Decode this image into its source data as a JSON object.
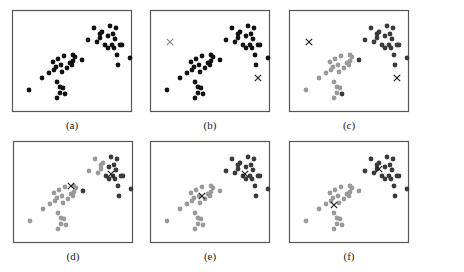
{
  "figure": {
    "colors": {
      "frame": "#555555",
      "unassigned": "#111111",
      "cluster_dark": "#3a3a3a",
      "cluster_light": "#9a9a9a",
      "centroid": "#222222",
      "centroid_light": "#888888"
    },
    "points": [
      [
        17,
        80
      ],
      [
        30,
        68
      ],
      [
        37,
        63
      ],
      [
        42,
        60
      ],
      [
        45,
        72
      ],
      [
        48,
        77
      ],
      [
        41,
        52
      ],
      [
        44,
        57
      ],
      [
        46,
        49
      ],
      [
        49,
        55
      ],
      [
        52,
        46
      ],
      [
        55,
        58
      ],
      [
        50,
        62
      ],
      [
        58,
        53
      ],
      [
        61,
        51
      ],
      [
        61,
        45
      ],
      [
        63,
        47
      ],
      [
        60,
        55
      ],
      [
        70,
        50
      ],
      [
        48,
        83
      ],
      [
        51,
        78
      ],
      [
        53,
        84
      ],
      [
        45,
        88
      ],
      [
        76,
        30
      ],
      [
        85,
        32
      ],
      [
        82,
        18
      ],
      [
        88,
        24
      ],
      [
        90,
        22
      ],
      [
        88,
        28
      ],
      [
        98,
        16
      ],
      [
        96,
        26
      ],
      [
        101,
        24
      ],
      [
        100,
        35
      ],
      [
        102,
        38
      ],
      [
        96,
        38
      ],
      [
        103,
        29
      ],
      [
        104,
        18
      ],
      [
        108,
        35
      ],
      [
        105,
        45
      ],
      [
        93,
        35
      ],
      [
        110,
        35
      ],
      [
        106,
        55
      ],
      [
        118,
        48
      ]
    ],
    "panels": [
      {
        "label": "(a)",
        "left": 12,
        "top": 10,
        "mode": "raw",
        "centroids": []
      },
      {
        "label": "(b)",
        "left": 150,
        "top": 10,
        "mode": "raw",
        "centroids": [
          [
            20,
            32,
            "light"
          ],
          [
            108,
            68,
            "dark"
          ]
        ]
      },
      {
        "label": "(c)",
        "left": 289,
        "top": 10,
        "mode": "init",
        "centroids": [
          [
            20,
            32,
            "light"
          ],
          [
            108,
            68,
            "dark"
          ]
        ]
      },
      {
        "label": "(d)",
        "left": 13,
        "top": 141,
        "mode": "iter1",
        "centroids": [
          [
            58,
            45,
            "light"
          ],
          [
            98,
            33,
            "dark"
          ]
        ]
      },
      {
        "label": "(e)",
        "left": 150,
        "top": 141,
        "mode": "iter2",
        "centroids": [
          [
            52,
            55,
            "light"
          ],
          [
            95,
            33,
            "dark"
          ]
        ]
      },
      {
        "label": "(f)",
        "left": 289,
        "top": 141,
        "mode": "final",
        "centroids": [
          [
            45,
            64,
            "light"
          ],
          [
            90,
            28,
            "dark"
          ]
        ]
      }
    ]
  }
}
